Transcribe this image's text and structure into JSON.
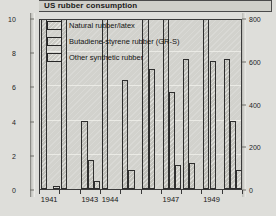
{
  "chart_data": {
    "type": "bar",
    "title": "US rubber consumption",
    "xlabel": "",
    "ylabel": "",
    "y2label": "Long tons (thousands)",
    "grid": true,
    "legend_position": "top-left",
    "ylim": [
      0,
      10
    ],
    "y2lim": [
      0,
      800
    ],
    "yticks": [
      "0",
      "2",
      "4",
      "6",
      "8",
      "10"
    ],
    "ytick_values": [
      0,
      2,
      4,
      6,
      8,
      10
    ],
    "y2ticks": [
      "0",
      "200",
      "400",
      "600",
      "800"
    ],
    "y2tick_values": [
      0,
      200,
      400,
      600,
      800
    ],
    "categories": [
      "1941",
      "1942",
      "1943",
      "1944",
      "1945",
      "1946",
      "1947",
      "1948",
      "1949",
      "1950"
    ],
    "xtick_labels": [
      "1941",
      "1943",
      "1944",
      "1947",
      "1949"
    ],
    "series": [
      {
        "name": "Natural rubber/latex",
        "values": [
          10.4,
          10.4,
          4.0,
          10.4,
          6.4,
          10.4,
          10.4,
          7.6,
          10.4,
          7.6
        ]
      },
      {
        "name": "Butadiene-styrene rubber (GR-S)",
        "values": [
          0.0,
          0.0,
          1.7,
          0.0,
          1.1,
          7.0,
          5.7,
          1.5,
          7.5,
          4.0
        ]
      },
      {
        "name": "Other synthetic rubber",
        "values": [
          0.15,
          0.0,
          0.45,
          0.0,
          0.0,
          0.0,
          1.4,
          0.0,
          0.0,
          1.1
        ]
      }
    ]
  },
  "legend": {
    "items": [
      {
        "label": "Natural rubber/latex"
      },
      {
        "label": "Butadiene-styrene rubber (GR-S)"
      },
      {
        "label": "Other synthetic rubber"
      }
    ]
  }
}
